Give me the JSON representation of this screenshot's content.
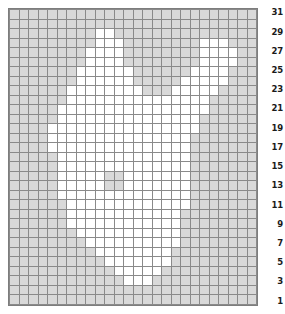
{
  "chart": {
    "type": "grid-chart",
    "columns": 26,
    "rows": 31,
    "colors": {
      "empty_cell": "#d9d9d9",
      "marked_cell": "#ffffff",
      "gridline": "#8a8a8a",
      "border": "#7d7d7d",
      "label_text": "#1a1a1a"
    },
    "row_labels": [
      "31",
      "29",
      "27",
      "25",
      "23",
      "21",
      "19",
      "17",
      "15",
      "13",
      "11",
      "9",
      "7",
      "5",
      "3",
      "1"
    ],
    "row_label_side": "right",
    "row_label_interval": 2
  },
  "chart_data": {
    "type": "heatmap",
    "xlabel": "",
    "ylabel": "",
    "legend": [],
    "grid": true,
    "columns": 26,
    "rows": 31,
    "value_map": {
      "0": "empty",
      "1": "marked"
    },
    "row_numbers_visible": [
      "1",
      "3",
      "5",
      "7",
      "9",
      "11",
      "13",
      "15",
      "17",
      "19",
      "21",
      "23",
      "25",
      "27",
      "29",
      "31"
    ],
    "matrix": [
      [
        0,
        0,
        0,
        0,
        0,
        0,
        0,
        0,
        0,
        0,
        0,
        0,
        0,
        0,
        0,
        0,
        0,
        0,
        0,
        0,
        0,
        0,
        0,
        0,
        0,
        0
      ],
      [
        0,
        0,
        0,
        0,
        0,
        0,
        0,
        0,
        0,
        0,
        0,
        0,
        0,
        0,
        0,
        0,
        0,
        0,
        0,
        0,
        0,
        0,
        0,
        0,
        0,
        0
      ],
      [
        0,
        0,
        0,
        0,
        0,
        0,
        0,
        0,
        0,
        1,
        1,
        0,
        0,
        0,
        0,
        0,
        0,
        0,
        0,
        0,
        0,
        0,
        0,
        0,
        0,
        0
      ],
      [
        0,
        0,
        0,
        0,
        0,
        0,
        0,
        0,
        0,
        1,
        1,
        1,
        0,
        0,
        0,
        0,
        0,
        0,
        0,
        0,
        1,
        1,
        1,
        0,
        0,
        0
      ],
      [
        0,
        0,
        0,
        0,
        0,
        0,
        0,
        0,
        1,
        1,
        1,
        1,
        0,
        0,
        0,
        0,
        0,
        0,
        0,
        0,
        1,
        1,
        1,
        1,
        0,
        0
      ],
      [
        0,
        0,
        0,
        0,
        0,
        0,
        0,
        0,
        1,
        1,
        1,
        1,
        0,
        0,
        0,
        0,
        0,
        0,
        0,
        0,
        1,
        1,
        1,
        1,
        0,
        0
      ],
      [
        0,
        0,
        0,
        0,
        0,
        0,
        0,
        1,
        1,
        1,
        1,
        1,
        1,
        0,
        0,
        0,
        0,
        0,
        0,
        1,
        1,
        1,
        1,
        0,
        0,
        0
      ],
      [
        0,
        0,
        0,
        0,
        0,
        0,
        0,
        1,
        1,
        1,
        1,
        1,
        1,
        0,
        0,
        0,
        0,
        0,
        1,
        1,
        1,
        1,
        1,
        0,
        0,
        0
      ],
      [
        0,
        0,
        0,
        0,
        0,
        0,
        1,
        1,
        1,
        1,
        1,
        1,
        1,
        1,
        0,
        0,
        0,
        1,
        1,
        1,
        1,
        1,
        0,
        0,
        0,
        0
      ],
      [
        0,
        0,
        0,
        0,
        0,
        0,
        1,
        1,
        1,
        1,
        1,
        1,
        1,
        1,
        1,
        1,
        1,
        1,
        1,
        1,
        1,
        0,
        0,
        0,
        0,
        0
      ],
      [
        0,
        0,
        0,
        0,
        0,
        1,
        1,
        1,
        1,
        1,
        1,
        1,
        1,
        1,
        1,
        1,
        1,
        1,
        1,
        1,
        1,
        0,
        0,
        0,
        0,
        0
      ],
      [
        0,
        0,
        0,
        0,
        0,
        1,
        1,
        1,
        1,
        1,
        1,
        1,
        1,
        1,
        1,
        1,
        1,
        1,
        1,
        1,
        0,
        0,
        0,
        0,
        0,
        0
      ],
      [
        0,
        0,
        0,
        0,
        1,
        1,
        1,
        1,
        1,
        1,
        1,
        1,
        1,
        1,
        1,
        1,
        1,
        1,
        1,
        1,
        0,
        0,
        0,
        0,
        0,
        0
      ],
      [
        0,
        0,
        0,
        0,
        1,
        1,
        1,
        1,
        1,
        1,
        1,
        1,
        1,
        1,
        1,
        1,
        1,
        1,
        1,
        0,
        0,
        0,
        0,
        0,
        0,
        0
      ],
      [
        0,
        0,
        0,
        0,
        1,
        1,
        1,
        1,
        1,
        1,
        1,
        1,
        1,
        1,
        1,
        1,
        1,
        1,
        1,
        0,
        0,
        0,
        0,
        0,
        0,
        0
      ],
      [
        0,
        0,
        0,
        0,
        0,
        1,
        1,
        1,
        1,
        1,
        1,
        1,
        1,
        1,
        1,
        1,
        1,
        1,
        1,
        0,
        0,
        0,
        0,
        0,
        0,
        0
      ],
      [
        0,
        0,
        0,
        0,
        0,
        1,
        1,
        1,
        1,
        1,
        1,
        1,
        1,
        1,
        1,
        1,
        1,
        1,
        1,
        0,
        0,
        0,
        0,
        0,
        0,
        0
      ],
      [
        0,
        0,
        0,
        0,
        0,
        1,
        1,
        1,
        1,
        1,
        0,
        0,
        1,
        1,
        1,
        1,
        1,
        1,
        1,
        0,
        0,
        0,
        0,
        0,
        0,
        0
      ],
      [
        0,
        0,
        0,
        0,
        0,
        1,
        1,
        1,
        1,
        1,
        0,
        0,
        1,
        1,
        1,
        1,
        1,
        1,
        1,
        0,
        0,
        0,
        0,
        0,
        0,
        0
      ],
      [
        0,
        0,
        0,
        0,
        0,
        1,
        1,
        1,
        1,
        1,
        1,
        1,
        1,
        1,
        1,
        1,
        1,
        1,
        1,
        0,
        0,
        0,
        0,
        0,
        0,
        0
      ],
      [
        0,
        0,
        0,
        0,
        0,
        0,
        1,
        1,
        1,
        1,
        1,
        1,
        1,
        1,
        1,
        1,
        1,
        1,
        1,
        0,
        0,
        0,
        0,
        0,
        0,
        0
      ],
      [
        0,
        0,
        0,
        0,
        0,
        0,
        1,
        1,
        1,
        1,
        1,
        1,
        1,
        1,
        1,
        1,
        1,
        1,
        0,
        0,
        0,
        0,
        0,
        0,
        0,
        0
      ],
      [
        0,
        0,
        0,
        0,
        0,
        0,
        1,
        1,
        1,
        1,
        1,
        1,
        1,
        1,
        1,
        1,
        1,
        1,
        0,
        0,
        0,
        0,
        0,
        0,
        0,
        0
      ],
      [
        0,
        0,
        0,
        0,
        0,
        0,
        0,
        1,
        1,
        1,
        1,
        1,
        1,
        1,
        1,
        1,
        1,
        1,
        0,
        0,
        0,
        0,
        0,
        0,
        0,
        0
      ],
      [
        0,
        0,
        0,
        0,
        0,
        0,
        0,
        0,
        1,
        1,
        1,
        1,
        1,
        1,
        1,
        1,
        1,
        1,
        0,
        0,
        0,
        0,
        0,
        0,
        0,
        0
      ],
      [
        0,
        0,
        0,
        0,
        0,
        0,
        0,
        0,
        0,
        1,
        1,
        1,
        1,
        1,
        1,
        1,
        1,
        0,
        0,
        0,
        0,
        0,
        0,
        0,
        0,
        0
      ],
      [
        0,
        0,
        0,
        0,
        0,
        0,
        0,
        0,
        0,
        0,
        1,
        1,
        1,
        1,
        1,
        1,
        1,
        0,
        0,
        0,
        0,
        0,
        0,
        0,
        0,
        0
      ],
      [
        0,
        0,
        0,
        0,
        0,
        0,
        0,
        0,
        0,
        0,
        0,
        1,
        1,
        1,
        1,
        1,
        0,
        0,
        0,
        0,
        0,
        0,
        0,
        0,
        0,
        0
      ],
      [
        0,
        0,
        0,
        0,
        0,
        0,
        0,
        0,
        0,
        0,
        0,
        0,
        1,
        1,
        1,
        0,
        0,
        0,
        0,
        0,
        0,
        0,
        0,
        0,
        0,
        0
      ],
      [
        0,
        0,
        0,
        0,
        0,
        0,
        0,
        0,
        0,
        0,
        0,
        0,
        0,
        0,
        0,
        0,
        0,
        0,
        0,
        0,
        0,
        0,
        0,
        0,
        0,
        0
      ],
      [
        0,
        0,
        0,
        0,
        0,
        0,
        0,
        0,
        0,
        0,
        0,
        0,
        0,
        0,
        0,
        0,
        0,
        0,
        0,
        0,
        0,
        0,
        0,
        0,
        0,
        0
      ]
    ]
  }
}
